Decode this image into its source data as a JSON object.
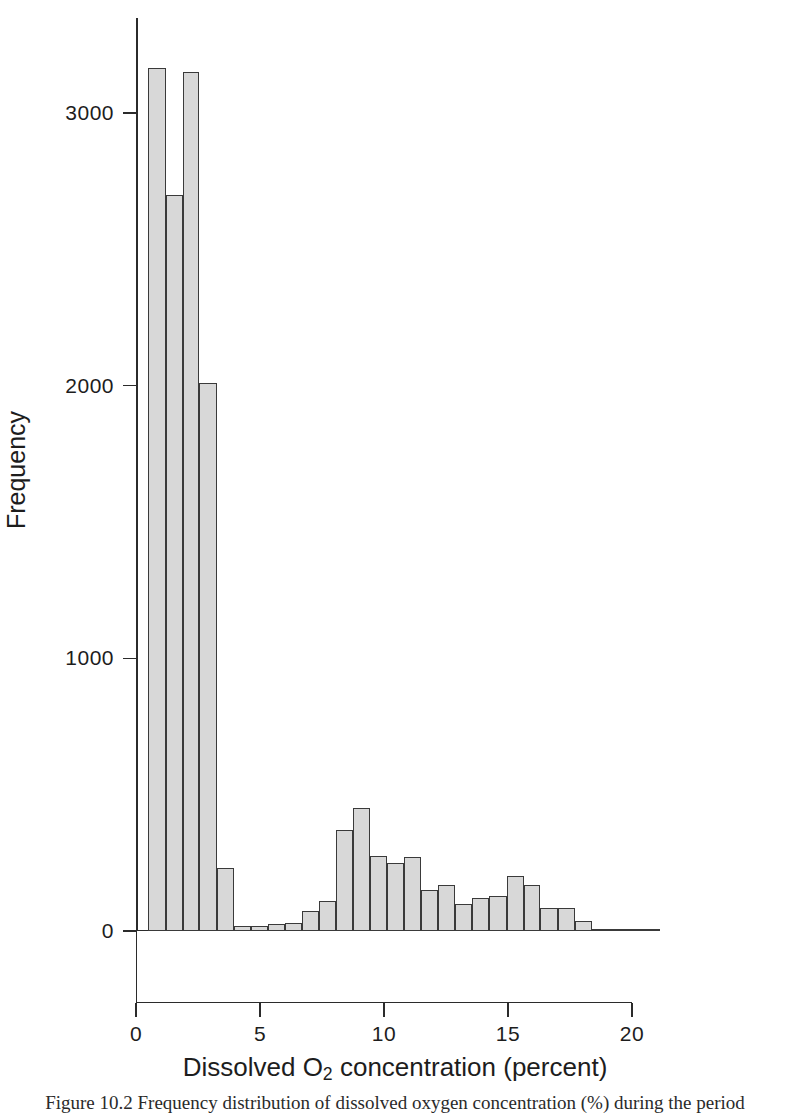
{
  "figure": {
    "xlabel_prefix": "Dissolved O",
    "xlabel_sub": "2",
    "xlabel_suffix": " concentration (percent)",
    "ylabel": "Frequency",
    "caption": "Figure 10.2  Frequency distribution of dissolved oxygen concentration (%) during the period"
  },
  "chart_data": {
    "type": "bar",
    "title": "",
    "subtitle": "",
    "xlabel": "Dissolved O2 concentration (percent)",
    "ylabel": "Frequency",
    "xlim": [
      0,
      20
    ],
    "ylim": [
      0,
      3300
    ],
    "xticks": [
      0,
      5,
      10,
      15,
      20
    ],
    "xtick_labels": [
      "0",
      "5",
      "10",
      "15",
      "20"
    ],
    "yticks": [
      0,
      1000,
      2000,
      3000
    ],
    "ytick_labels": [
      "0",
      "1000",
      "2000",
      "3000"
    ],
    "grid": false,
    "legend": null,
    "bin_width": 0.69,
    "bar_fill": "#d8d8d8",
    "bar_edge": "#3a3a3a",
    "bins": [
      {
        "x0": 0.5,
        "x1": 1.19,
        "center": 0.85,
        "value": 3165
      },
      {
        "x0": 1.19,
        "x1": 1.88,
        "center": 1.53,
        "value": 2700
      },
      {
        "x0": 1.88,
        "x1": 2.56,
        "center": 2.22,
        "value": 3150
      },
      {
        "x0": 2.56,
        "x1": 3.25,
        "center": 2.91,
        "value": 2010
      },
      {
        "x0": 3.25,
        "x1": 3.94,
        "center": 3.6,
        "value": 230
      },
      {
        "x0": 3.94,
        "x1": 4.63,
        "center": 4.28,
        "value": 18
      },
      {
        "x0": 4.63,
        "x1": 5.31,
        "center": 4.97,
        "value": 20
      },
      {
        "x0": 5.31,
        "x1": 6.0,
        "center": 5.66,
        "value": 26
      },
      {
        "x0": 6.0,
        "x1": 6.69,
        "center": 6.35,
        "value": 30
      },
      {
        "x0": 6.69,
        "x1": 7.38,
        "center": 7.03,
        "value": 75
      },
      {
        "x0": 7.38,
        "x1": 8.06,
        "center": 7.72,
        "value": 110
      },
      {
        "x0": 8.06,
        "x1": 8.75,
        "center": 8.41,
        "value": 370
      },
      {
        "x0": 8.75,
        "x1": 9.44,
        "center": 9.09,
        "value": 450
      },
      {
        "x0": 9.44,
        "x1": 10.13,
        "center": 9.78,
        "value": 275
      },
      {
        "x0": 10.13,
        "x1": 10.81,
        "center": 10.47,
        "value": 250
      },
      {
        "x0": 10.81,
        "x1": 11.5,
        "center": 11.16,
        "value": 272
      },
      {
        "x0": 11.5,
        "x1": 12.19,
        "center": 11.84,
        "value": 152
      },
      {
        "x0": 12.19,
        "x1": 12.88,
        "center": 12.53,
        "value": 170
      },
      {
        "x0": 12.88,
        "x1": 13.56,
        "center": 13.22,
        "value": 98
      },
      {
        "x0": 13.56,
        "x1": 14.25,
        "center": 13.91,
        "value": 122
      },
      {
        "x0": 14.25,
        "x1": 14.94,
        "center": 14.59,
        "value": 128
      },
      {
        "x0": 14.94,
        "x1": 15.63,
        "center": 15.28,
        "value": 200
      },
      {
        "x0": 15.63,
        "x1": 16.31,
        "center": 15.97,
        "value": 168
      },
      {
        "x0": 16.31,
        "x1": 17.0,
        "center": 16.66,
        "value": 85
      },
      {
        "x0": 17.0,
        "x1": 17.69,
        "center": 17.34,
        "value": 85
      },
      {
        "x0": 17.69,
        "x1": 18.38,
        "center": 18.03,
        "value": 38
      },
      {
        "x0": 18.38,
        "x1": 19.06,
        "center": 18.72,
        "value": 5
      },
      {
        "x0": 19.06,
        "x1": 19.75,
        "center": 19.41,
        "value": 4
      },
      {
        "x0": 19.75,
        "x1": 20.44,
        "center": 20.09,
        "value": 3
      },
      {
        "x0": 20.44,
        "x1": 21.13,
        "center": 20.78,
        "value": 3
      }
    ]
  }
}
